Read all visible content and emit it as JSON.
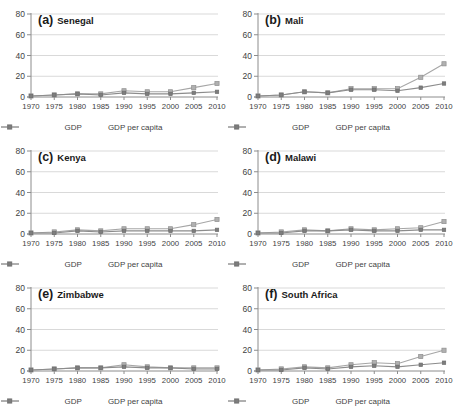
{
  "figure_title": "GDP and GDP per capita line charts for six African countries, 1970-2010",
  "legend": {
    "gdp": "GDP",
    "gdp_per_capita": "GDP per capita"
  },
  "style": {
    "gdp_line_color": "#a6a6a6",
    "gdp_marker_fill": "#b0b0b0",
    "gdp_marker_stroke": "#8f8f8f",
    "pc_line_color": "#8c8c8c",
    "pc_marker_fill": "#7d7d7d",
    "pc_marker_stroke": "#6e6e6e",
    "gridline_color": "#d9d9d9",
    "axis_color": "#8c8c8c",
    "tick_label_color": "#3f3f3f"
  },
  "chart_data": [
    {
      "type": "line",
      "label": "(a)",
      "title": "Senegal",
      "x": [
        1970,
        1975,
        1980,
        1985,
        1990,
        1995,
        2000,
        2005,
        2010
      ],
      "series": [
        {
          "name": "GDP",
          "values": [
            1,
            2,
            3,
            3,
            6,
            5,
            5,
            9,
            13
          ]
        },
        {
          "name": "GDP per capita",
          "values": [
            1,
            2,
            3,
            2,
            4,
            3,
            3,
            4,
            5
          ]
        }
      ],
      "ylim": [
        0,
        80
      ],
      "yticks": [
        0,
        20,
        40,
        60,
        80
      ],
      "grid": true,
      "legend_position": "bottom"
    },
    {
      "type": "line",
      "label": "(b)",
      "title": "Mali",
      "x": [
        1970,
        1975,
        1980,
        1985,
        1990,
        1995,
        2000,
        2005,
        2010
      ],
      "series": [
        {
          "name": "GDP",
          "values": [
            1,
            2,
            5,
            4,
            8,
            8,
            8,
            19,
            32
          ]
        },
        {
          "name": "GDP per capita",
          "values": [
            1,
            2,
            5,
            4,
            7,
            7,
            6,
            9,
            13
          ]
        }
      ],
      "ylim": [
        0,
        80
      ],
      "yticks": [
        0,
        20,
        40,
        60,
        80
      ],
      "grid": true,
      "legend_position": "bottom"
    },
    {
      "type": "line",
      "label": "(c)",
      "title": "Kenya",
      "x": [
        1970,
        1975,
        1980,
        1985,
        1990,
        1995,
        2000,
        2005,
        2010
      ],
      "series": [
        {
          "name": "GDP",
          "values": [
            1,
            2,
            4,
            3,
            5,
            5,
            5,
            9,
            14
          ]
        },
        {
          "name": "GDP per capita",
          "values": [
            1,
            1,
            3,
            2,
            3,
            3,
            3,
            3,
            4
          ]
        }
      ],
      "ylim": [
        0,
        80
      ],
      "yticks": [
        0,
        20,
        40,
        60,
        80
      ],
      "grid": true,
      "legend_position": "bottom"
    },
    {
      "type": "line",
      "label": "(d)",
      "title": "Malawi",
      "x": [
        1970,
        1975,
        1980,
        1985,
        1990,
        1995,
        2000,
        2005,
        2010
      ],
      "series": [
        {
          "name": "GDP",
          "values": [
            1,
            2,
            4,
            3,
            5,
            4,
            5,
            6,
            12
          ]
        },
        {
          "name": "GDP per capita",
          "values": [
            1,
            1,
            3,
            3,
            4,
            3,
            3,
            4,
            4
          ]
        }
      ],
      "ylim": [
        0,
        80
      ],
      "yticks": [
        0,
        20,
        40,
        60,
        80
      ],
      "grid": true,
      "legend_position": "bottom"
    },
    {
      "type": "line",
      "label": "(e)",
      "title": "Zimbabwe",
      "x": [
        1970,
        1975,
        1980,
        1985,
        1990,
        1995,
        2000,
        2005,
        2010
      ],
      "series": [
        {
          "name": "GDP",
          "values": [
            1,
            2,
            3,
            3,
            6,
            4,
            3,
            3,
            3
          ]
        },
        {
          "name": "GDP per capita",
          "values": [
            1,
            2,
            3,
            3,
            4,
            3,
            3,
            2,
            2
          ]
        }
      ],
      "ylim": [
        0,
        80
      ],
      "yticks": [
        0,
        20,
        40,
        60,
        80
      ],
      "grid": true,
      "legend_position": "bottom"
    },
    {
      "type": "line",
      "label": "(f)",
      "title": "South Africa",
      "x": [
        1970,
        1975,
        1980,
        1985,
        1990,
        1995,
        2000,
        2005,
        2010
      ],
      "series": [
        {
          "name": "GDP",
          "values": [
            1,
            2,
            4,
            3,
            6,
            8,
            7,
            14,
            20
          ]
        },
        {
          "name": "GDP per capita",
          "values": [
            1,
            1,
            3,
            2,
            4,
            5,
            4,
            6,
            8
          ]
        }
      ],
      "ylim": [
        0,
        80
      ],
      "yticks": [
        0,
        20,
        40,
        60,
        80
      ],
      "grid": true,
      "legend_position": "bottom"
    }
  ]
}
